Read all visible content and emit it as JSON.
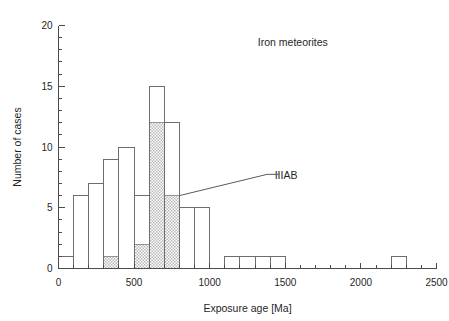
{
  "chart_data": {
    "type": "bar",
    "title": "Iron meteorites",
    "xlabel": "Exposure age [Ma]",
    "ylabel": "Number of cases",
    "xlim": [
      0,
      2500
    ],
    "ylim": [
      0,
      20
    ],
    "grid": false,
    "bin_width": 100,
    "x_ticks_major": [
      0,
      500,
      1000,
      1500,
      2000,
      2500
    ],
    "x_ticks_major_labels": [
      "0",
      "500",
      "1000",
      "1500",
      "2000",
      "2500"
    ],
    "x_tick_minor_step": 100,
    "y_ticks_major": [
      0,
      5,
      10,
      15,
      20
    ],
    "y_ticks_major_labels": [
      "0",
      "5",
      "10",
      "15",
      "20"
    ],
    "y_tick_minor_step": 1,
    "legend_position": "annotation",
    "annotations": [
      {
        "text": "Iron meteorites",
        "x": 1550,
        "y": 18.3
      },
      {
        "text": "IIIAB",
        "x": 1430,
        "y": 7.4
      }
    ],
    "series": [
      {
        "name": "All iron meteorites",
        "style": "open",
        "bins": [
          {
            "x0": 0,
            "x1": 100,
            "value": 1
          },
          {
            "x0": 100,
            "x1": 200,
            "value": 6
          },
          {
            "x0": 200,
            "x1": 300,
            "value": 7
          },
          {
            "x0": 300,
            "x1": 400,
            "value": 9
          },
          {
            "x0": 400,
            "x1": 500,
            "value": 10
          },
          {
            "x0": 500,
            "x1": 600,
            "value": 6
          },
          {
            "x0": 600,
            "x1": 700,
            "value": 15
          },
          {
            "x0": 700,
            "x1": 800,
            "value": 12
          },
          {
            "x0": 800,
            "x1": 900,
            "value": 5
          },
          {
            "x0": 900,
            "x1": 1000,
            "value": 5
          },
          {
            "x0": 1100,
            "x1": 1200,
            "value": 1
          },
          {
            "x0": 1200,
            "x1": 1300,
            "value": 1
          },
          {
            "x0": 1300,
            "x1": 1400,
            "value": 1
          },
          {
            "x0": 1400,
            "x1": 1500,
            "value": 1
          },
          {
            "x0": 2200,
            "x1": 2300,
            "value": 1
          }
        ]
      },
      {
        "name": "IIIAB",
        "style": "hatched",
        "bins": [
          {
            "x0": 300,
            "x1": 400,
            "value": 1
          },
          {
            "x0": 500,
            "x1": 600,
            "value": 2
          },
          {
            "x0": 600,
            "x1": 700,
            "value": 12
          },
          {
            "x0": 700,
            "x1": 800,
            "value": 6
          }
        ]
      }
    ]
  },
  "colors": {
    "background": "#ffffff",
    "axis": "#4a4a4a",
    "bar_outline": "#6e6e6e",
    "hatch_fill": "#c8c8c8",
    "text": "#1f1f1f"
  }
}
